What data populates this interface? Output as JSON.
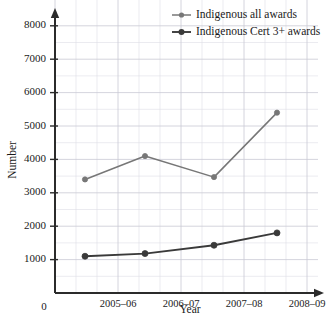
{
  "chart_data": {
    "type": "line",
    "title": "",
    "xlabel": "Year",
    "ylabel": "Number",
    "x": [
      "2004–05",
      "2005–06",
      "2006–07",
      "2007–08"
    ],
    "categories": [
      "2005–06",
      "2006–07",
      "2007–08",
      "2008–09"
    ],
    "xtick_labels": [
      "2005–06",
      "2006–07",
      "2007–08",
      "2008–09"
    ],
    "ytick_labels": [
      "0",
      "1000",
      "2000",
      "3000",
      "4000",
      "5000",
      "6000",
      "7000",
      "8000"
    ],
    "ytick_values": [
      0,
      1000,
      2000,
      3000,
      4000,
      5000,
      6000,
      7000,
      8000
    ],
    "ylim": [
      0,
      8400
    ],
    "grid": true,
    "legend_position": "top-right",
    "origin_label": "0",
    "series": [
      {
        "name": "Indigenous all awards",
        "color": "#777777",
        "marker": "circle",
        "values": [
          3400,
          4100,
          3470,
          5400
        ]
      },
      {
        "name": "Indigenous Cert 3+ awards",
        "color": "#3a3a3a",
        "marker": "circle",
        "values": [
          1100,
          1180,
          1430,
          1800
        ]
      }
    ]
  },
  "legend": {
    "items": [
      {
        "label": "Indigenous all awards",
        "color": "#777777"
      },
      {
        "label": "Indigenous Cert 3+ awards",
        "color": "#3a3a3a"
      }
    ]
  },
  "axes": {
    "y_title": "Number",
    "x_title": "Year",
    "origin": "0"
  },
  "colors": {
    "grid": "#c9c9d4",
    "grid_minor": "#dedee6",
    "axis": "#2b2b2b",
    "series_light": "#777777",
    "series_dark": "#3a3a3a",
    "text": "#1a1a1a",
    "background": "#ffffff"
  }
}
